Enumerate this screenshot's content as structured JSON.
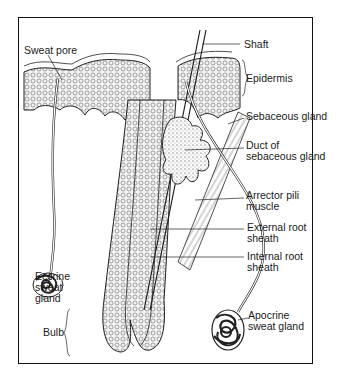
{
  "diagram": {
    "labels": {
      "sweat_pore": "Sweat pore",
      "shaft": "Shaft",
      "epidermis": "Epidermis",
      "sebaceous_gland": "Sebaceous gland",
      "duct_of_sebaceous_gland": "Duct of\nsebaceous gland",
      "arrector_pili_muscle": "Arrector pili\nmuscle",
      "external_root_sheath": "External root\nsheath",
      "internal_root_sheath": "Internal root\nsheath",
      "eccrine_sweat_gland": "Eccrine\nsweat\ngland",
      "bulb": "Bulb",
      "apocrine_sweat_gland": "Apocrine\nsweat gland"
    },
    "colors": {
      "ink": "#1a1a1a",
      "background": "#ffffff",
      "stipple": "#e9e9e9"
    }
  }
}
